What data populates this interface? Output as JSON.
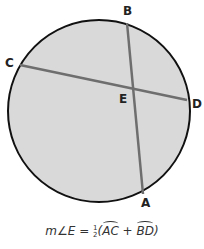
{
  "diagram": {
    "type": "circle-intersecting-chords",
    "circle": {
      "cx": 99,
      "cy": 111,
      "r": 91,
      "fill": "#d9d9d9",
      "stroke": "#111111"
    },
    "chords": [
      {
        "name": "AB",
        "from": "B",
        "to": "A",
        "stroke": "#6e6e6e"
      },
      {
        "name": "CD",
        "from": "C",
        "to": "D",
        "stroke": "#6e6e6e"
      }
    ],
    "points": {
      "A": {
        "label": "A"
      },
      "B": {
        "label": "B"
      },
      "C": {
        "label": "C"
      },
      "D": {
        "label": "D"
      },
      "E": {
        "label": "E"
      }
    }
  },
  "formula": {
    "prefix": "m∠E = ",
    "frac_num": "1",
    "frac_den": "2",
    "open": "(",
    "arc1": "AC",
    "plus": " + ",
    "arc2": "BD",
    "close": ")"
  }
}
